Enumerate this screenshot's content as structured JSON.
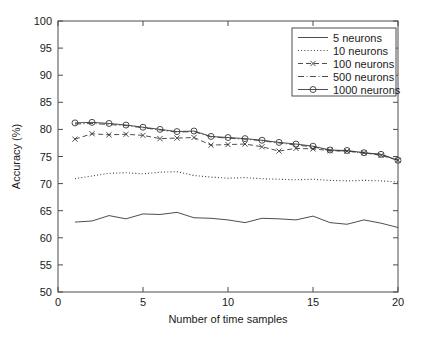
{
  "chart_data": {
    "type": "line",
    "title": "",
    "xlabel": "Number of time samples",
    "ylabel": "Accuracy (%)",
    "xlim": [
      0,
      20
    ],
    "ylim": [
      50,
      100
    ],
    "xticks": [
      0,
      5,
      10,
      15,
      20
    ],
    "yticks": [
      50,
      55,
      60,
      65,
      70,
      75,
      80,
      85,
      90,
      95,
      100
    ],
    "xtick_labels": [
      "0",
      "5",
      "10",
      "15",
      "20"
    ],
    "ytick_labels": [
      "50",
      "55",
      "60",
      "65",
      "70",
      "75",
      "80",
      "85",
      "90",
      "95",
      "100"
    ],
    "grid": false,
    "legend_position": "top-right",
    "x": [
      1,
      2,
      3,
      4,
      5,
      6,
      7,
      8,
      9,
      10,
      11,
      12,
      13,
      14,
      15,
      16,
      17,
      18,
      19,
      20
    ],
    "series": [
      {
        "name": "5 neurons",
        "style": "solid",
        "marker": "none",
        "color": "#3a3a3a",
        "values": [
          62.9,
          63.1,
          64.1,
          63.5,
          64.4,
          64.3,
          64.7,
          63.7,
          63.6,
          63.3,
          62.8,
          63.6,
          63.5,
          63.3,
          64.0,
          62.8,
          62.5,
          63.3,
          62.7,
          61.9
        ]
      },
      {
        "name": "10 neurons",
        "style": "dotted",
        "marker": "none",
        "color": "#3a3a3a",
        "values": [
          70.9,
          71.4,
          71.9,
          72.0,
          71.8,
          72.1,
          72.2,
          71.5,
          71.2,
          71.0,
          71.1,
          70.9,
          70.8,
          70.7,
          70.8,
          70.6,
          70.5,
          70.6,
          70.5,
          70.3
        ]
      },
      {
        "name": "100 neurons",
        "style": "dashed",
        "marker": "x",
        "color": "#3a3a3a",
        "values": [
          78.2,
          79.2,
          79.0,
          79.1,
          78.9,
          78.3,
          78.4,
          78.5,
          77.1,
          77.2,
          77.3,
          76.8,
          76.0,
          76.5,
          76.4,
          76.1,
          76.0,
          75.7,
          75.2,
          74.3
        ]
      },
      {
        "name": "500 neurons",
        "style": "dashdot",
        "marker": "none",
        "color": "#3a3a3a",
        "values": [
          81.0,
          81.1,
          80.9,
          80.7,
          80.3,
          79.9,
          79.5,
          79.6,
          78.6,
          78.4,
          78.2,
          77.9,
          77.5,
          77.1,
          76.8,
          76.1,
          76.0,
          75.6,
          75.4,
          74.3
        ]
      },
      {
        "name": "1000 neurons",
        "style": "solid",
        "marker": "o",
        "color": "#3a3a3a",
        "values": [
          81.2,
          81.3,
          81.1,
          80.8,
          80.4,
          80.0,
          79.6,
          79.7,
          78.7,
          78.5,
          78.3,
          78.0,
          77.6,
          77.3,
          76.9,
          76.2,
          76.1,
          75.7,
          75.4,
          74.3
        ]
      }
    ]
  },
  "legend": {
    "entries": [
      {
        "label": "5 neurons"
      },
      {
        "label": "10 neurons"
      },
      {
        "label": "100 neurons"
      },
      {
        "label": "500 neurons"
      },
      {
        "label": "1000 neurons"
      }
    ]
  }
}
